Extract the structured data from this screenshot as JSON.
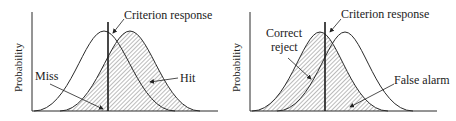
{
  "panels": [
    {
      "id": "left",
      "y_axis_label": "Probability",
      "criterion_label": "Criterion response",
      "labels": {
        "left": "Miss",
        "right": "Hit"
      },
      "shaded_distribution": "signal (right curve)"
    },
    {
      "id": "right",
      "y_axis_label": "Probability",
      "criterion_label": "Criterion response",
      "labels": {
        "left_line1": "Correct",
        "left_line2": "reject",
        "right": "False alarm"
      },
      "shaded_distribution": "noise (left curve)"
    }
  ],
  "colors": {
    "line": "#2a2a2a",
    "hatch": "#555555",
    "background": "#ffffff"
  }
}
